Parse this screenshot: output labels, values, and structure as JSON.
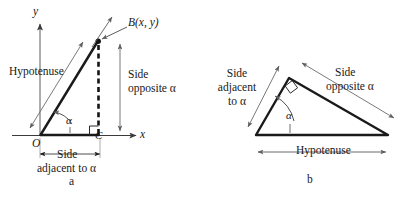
{
  "figure": {
    "title_kind": "right-triangle-trigonometry-definitions",
    "panels": [
      {
        "id": "a",
        "letter": "a",
        "axes": {
          "y_axis_label": "y",
          "x_axis_label": "x",
          "origin_label": "O"
        },
        "points": {
          "vertex_b_label": "B(x, y)",
          "vertex_c_label": "C"
        },
        "annotations": {
          "hypotenuse": "Hypotenuse",
          "side_opposite_line1": "Side",
          "side_opposite_line2": "opposite α",
          "side_adjacent_line1": "Side",
          "side_adjacent_line2": "adjacent to α",
          "angle_symbol": "α",
          "right_angle_marker": "right-angle-square"
        }
      },
      {
        "id": "b",
        "letter": "b",
        "annotations": {
          "side_adjacent_line1": "Side",
          "side_adjacent_line2": "adjacent",
          "side_adjacent_line3": "to α",
          "side_opposite_line1": "Side",
          "side_opposite_line2": "opposite α",
          "hypotenuse": "Hypotenuse",
          "angle_symbol": "α",
          "right_angle_marker": "right-angle-square"
        }
      }
    ],
    "colors": {
      "ink": "#181818",
      "triangle_stroke": "#1a1a1a",
      "thin_rule": "#6a6a6a",
      "background": "#ffffff"
    }
  }
}
